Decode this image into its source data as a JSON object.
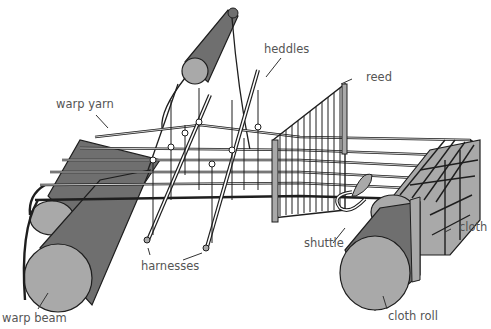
{
  "diagram": {
    "colors": {
      "fill_light": "#a9a9a9",
      "fill_dark": "#6f6f6f",
      "stroke": "#1e1e1e",
      "label": "#555555",
      "background": "#ffffff"
    },
    "labels": {
      "heddles": "heddles",
      "reed": "reed",
      "warp_yarn": "warp yarn",
      "shuttle": "shuttle",
      "cloth": "cloth",
      "harnesses": "harnesses",
      "warp_beam": "warp beam",
      "cloth_roll": "cloth roll"
    }
  }
}
